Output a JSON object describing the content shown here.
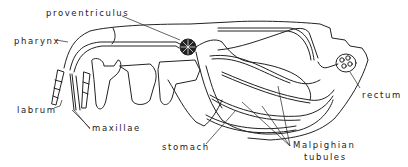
{
  "diagram": {
    "colors": {
      "ink": "#222222",
      "background": "#ffffff"
    },
    "labels": [
      {
        "id": "proventriculus",
        "text": "proventriculus",
        "x": 46,
        "y": 10
      },
      {
        "id": "pharynx",
        "text": "pharynx",
        "x": 14,
        "y": 38
      },
      {
        "id": "labrum",
        "text": "labrum",
        "x": 17,
        "y": 107
      },
      {
        "id": "maxillae",
        "text": "maxillae",
        "x": 92,
        "y": 125
      },
      {
        "id": "rectum",
        "text": "rectum",
        "x": 362,
        "y": 92
      },
      {
        "id": "stomach",
        "text": "stomach",
        "x": 162,
        "y": 144
      },
      {
        "id": "malpighian",
        "text": "Malpighian",
        "x": 293,
        "y": 142
      },
      {
        "id": "tubules",
        "text": "tubules",
        "x": 304,
        "y": 154
      }
    ]
  }
}
